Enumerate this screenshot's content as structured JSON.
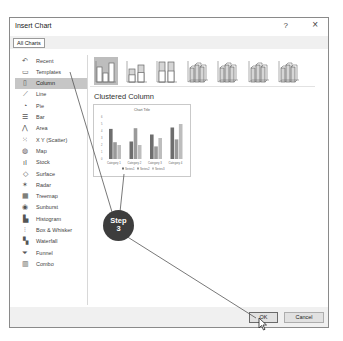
{
  "dialog": {
    "title": "Insert Chart",
    "help_label": "?",
    "close_label": "×",
    "tabs": [
      {
        "label": "All Charts",
        "active": true
      }
    ]
  },
  "sidebar": {
    "items": [
      {
        "label": "Recent",
        "icon": "recent-icon",
        "glyph": "↶"
      },
      {
        "label": "Templates",
        "icon": "templates-icon",
        "glyph": "▭"
      },
      {
        "label": "Column",
        "icon": "column-chart-icon",
        "glyph": "▯",
        "selected": true
      },
      {
        "label": "Line",
        "icon": "line-chart-icon",
        "glyph": "⟋"
      },
      {
        "label": "Pie",
        "icon": "pie-chart-icon",
        "glyph": "◔"
      },
      {
        "label": "Bar",
        "icon": "bar-chart-icon",
        "glyph": "☰"
      },
      {
        "label": "Area",
        "icon": "area-chart-icon",
        "glyph": "⋀"
      },
      {
        "label": "X Y (Scatter)",
        "icon": "scatter-chart-icon",
        "glyph": "⁙"
      },
      {
        "label": "Map",
        "icon": "map-chart-icon",
        "glyph": "◍"
      },
      {
        "label": "Stock",
        "icon": "stock-chart-icon",
        "glyph": "ıI"
      },
      {
        "label": "Surface",
        "icon": "surface-chart-icon",
        "glyph": "◇"
      },
      {
        "label": "Radar",
        "icon": "radar-chart-icon",
        "glyph": "✶"
      },
      {
        "label": "Treemap",
        "icon": "treemap-chart-icon",
        "glyph": "▦"
      },
      {
        "label": "Sunburst",
        "icon": "sunburst-chart-icon",
        "glyph": "◉"
      },
      {
        "label": "Histogram",
        "icon": "histogram-chart-icon",
        "glyph": "▙"
      },
      {
        "label": "Box & Whisker",
        "icon": "box-whisker-chart-icon",
        "glyph": "⫶"
      },
      {
        "label": "Waterfall",
        "icon": "waterfall-chart-icon",
        "glyph": "▚"
      },
      {
        "label": "Funnel",
        "icon": "funnel-chart-icon",
        "glyph": "⏷"
      },
      {
        "label": "Combo",
        "icon": "combo-chart-icon",
        "glyph": "▥"
      }
    ]
  },
  "content": {
    "subtypes": [
      {
        "name": "clustered-column",
        "selected": true
      },
      {
        "name": "stacked-column"
      },
      {
        "name": "100-stacked-column"
      },
      {
        "name": "3d-clustered-column"
      },
      {
        "name": "3d-stacked-column"
      },
      {
        "name": "3d-100-stacked-column"
      },
      {
        "name": "3d-column"
      }
    ],
    "subtype_title": "Clustered Column",
    "preview": {
      "chart_title": "Chart Title",
      "categories": [
        "Category 1",
        "Category 2",
        "Category 3",
        "Category 4"
      ],
      "legend": [
        "Series1",
        "Series2",
        "Series3"
      ],
      "y_ticks": [
        "6",
        "5",
        "4",
        "3",
        "2",
        "1",
        "0"
      ],
      "series_values": [
        [
          4.3,
          2.5,
          3.5,
          4.5
        ],
        [
          2.4,
          4.4,
          1.8,
          2.8
        ],
        [
          2,
          2,
          3,
          5
        ]
      ],
      "colors": [
        "#6e6e6e",
        "#9a9a9a",
        "#bdbdbd"
      ]
    }
  },
  "footer": {
    "ok_label": "OK",
    "cancel_label": "Cancel"
  },
  "annotation": {
    "step_label": "Step",
    "step_number": "3"
  }
}
